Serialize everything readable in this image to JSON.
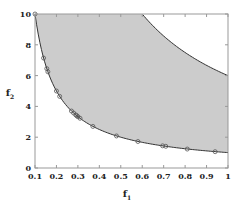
{
  "chart_data": {
    "type": "area",
    "title": "",
    "xlabel": "f",
    "xlabel_sub": "1",
    "ylabel": "f",
    "ylabel_sub": "2",
    "xlim": [
      0.1,
      1
    ],
    "ylim": [
      0,
      10
    ],
    "xticks": [
      0.1,
      0.2,
      0.3,
      0.4,
      0.5,
      0.6,
      0.7,
      0.8,
      0.9,
      1
    ],
    "xtick_labels": [
      "0.1",
      "0.2",
      "0.3",
      "0.4",
      "0.5",
      "0.6",
      "0.7",
      "0.8",
      "0.9",
      "1"
    ],
    "yticks": [
      0,
      2,
      4,
      6,
      8,
      10
    ],
    "ytick_labels": [
      "0",
      "2",
      "4",
      "6",
      "8",
      "10"
    ],
    "grid": false,
    "legend": null,
    "region": {
      "description": "Feasible region between lower boundary f2=1/f1 and upper boundary f2=6/f1",
      "fill": "#cccccc",
      "lower_boundary": "f2 = 1/f1",
      "upper_boundary": "f2 = 6/f1"
    },
    "series": [
      {
        "name": "Pareto points",
        "type": "scatter",
        "marker": "open-circle",
        "x": [
          0.1,
          0.14,
          0.155,
          0.16,
          0.2,
          0.215,
          0.27,
          0.28,
          0.29,
          0.295,
          0.3,
          0.31,
          0.37,
          0.48,
          0.58,
          0.695,
          0.71,
          0.81,
          0.94
        ],
        "y": [
          10.0,
          7.14,
          6.45,
          6.25,
          5.0,
          4.65,
          3.7,
          3.57,
          3.45,
          3.39,
          3.33,
          3.23,
          2.7,
          2.08,
          1.72,
          1.44,
          1.41,
          1.23,
          1.06
        ]
      }
    ]
  },
  "colors": {
    "region_fill": "#cccccc",
    "curve": "#333333",
    "axis": "#999999",
    "marker": "#555555"
  }
}
